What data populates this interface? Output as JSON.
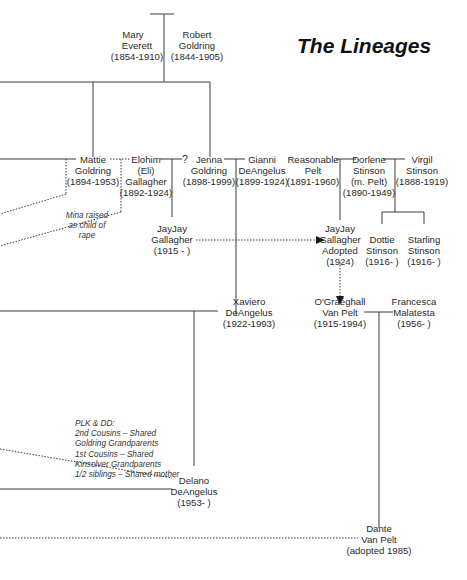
{
  "title": "The Lineages",
  "people": {
    "mary": {
      "first": "Mary",
      "last": "Everett",
      "dates": "(1854-1910)"
    },
    "robert": {
      "first": "Robert",
      "last": "Goldring",
      "dates": "(1844-1905)"
    },
    "mattie": {
      "first": "Mattie",
      "last": "Goldring",
      "dates": "(1894-1953)"
    },
    "elohim": {
      "first": "Elohim",
      "nick": "(Eli)",
      "last": "Gallagher",
      "dates": "(1892-1924)"
    },
    "jenna": {
      "first": "Jenna",
      "last": "Goldring",
      "dates": "(1898-1999)"
    },
    "gianni": {
      "first": "Gianni",
      "last": "DeAngelus",
      "dates": "(1899-1924)"
    },
    "reasonable": {
      "first": "Reasonable",
      "last": "Pelt",
      "dates": "(1891-1960)"
    },
    "dorlene": {
      "first": "Dorlene",
      "last": "Stinson",
      "married": "(m. Pelt)",
      "dates": "(1890-1949)"
    },
    "virgil": {
      "first": "Virgil",
      "last": "Stinson",
      "dates": "(1888-1919)"
    },
    "jayjay": {
      "first": "JayJay",
      "last": "Gallagher",
      "dates": "(1915 - )"
    },
    "jayjay_adopted": {
      "first": "JayJay",
      "last": "Gallagher",
      "status": "Adopted",
      "dates": "(1924)"
    },
    "dottie": {
      "first": "Dottie",
      "last": "Stinson",
      "dates": "(1916- )"
    },
    "starling": {
      "first": "Starling",
      "last": "Stinson",
      "dates": "(1916- )"
    },
    "xaviero": {
      "first": "Xaviero",
      "last": "DeAngelus",
      "dates": "(1922-1993)"
    },
    "ograeghall": {
      "first": "O'Graéghall",
      "last": "Van Pelt",
      "dates": "(1915-1994)"
    },
    "francesca": {
      "first": "Francesca",
      "last": "Malatesta",
      "dates": "(1956- )"
    },
    "delano": {
      "first": "Delano",
      "last": "DeAngelus",
      "dates": "(1953- )"
    },
    "dante": {
      "first": "Dante",
      "last": "Van Pelt",
      "dates": "(adopted 1985)"
    }
  },
  "unknown_marker": "?",
  "notes": {
    "mina": [
      "Mina raised",
      "as child of",
      "rape"
    ],
    "plk_dd": [
      "PLK & DD:",
      "2nd Cousins – Shared",
      "Goldring Grandparents",
      "1st Cousins – Shared",
      "Kinsolver Grandparents",
      "1/2 siblings – Shared mother"
    ]
  },
  "colors": {
    "line": "#3a3a3a",
    "text": "#2a2a2a",
    "title": "#111111",
    "background": "#ffffff"
  }
}
